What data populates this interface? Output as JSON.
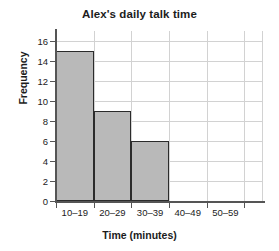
{
  "chart_data": {
    "type": "bar",
    "title": "Alex's daily talk time",
    "xlabel": "Time (minutes)",
    "ylabel": "Frequency",
    "categories": [
      "10–19",
      "20–29",
      "30–39",
      "40–49",
      "50–59"
    ],
    "values": [
      15,
      9,
      6,
      0,
      0
    ],
    "ylim": [
      0,
      17
    ],
    "ytick_labels": [
      "0",
      "2",
      "4",
      "6",
      "8",
      "10",
      "12",
      "14",
      "16"
    ],
    "ytick_values": [
      0,
      2,
      4,
      6,
      8,
      10,
      12,
      14,
      16
    ],
    "grid": true,
    "legend": "none",
    "bar_color": "#b9b9b9",
    "bar_edge_color": "#2b2b2b",
    "grid_color": "#d2d2d2",
    "axis_color": "#555555",
    "background": "#ffffff"
  }
}
